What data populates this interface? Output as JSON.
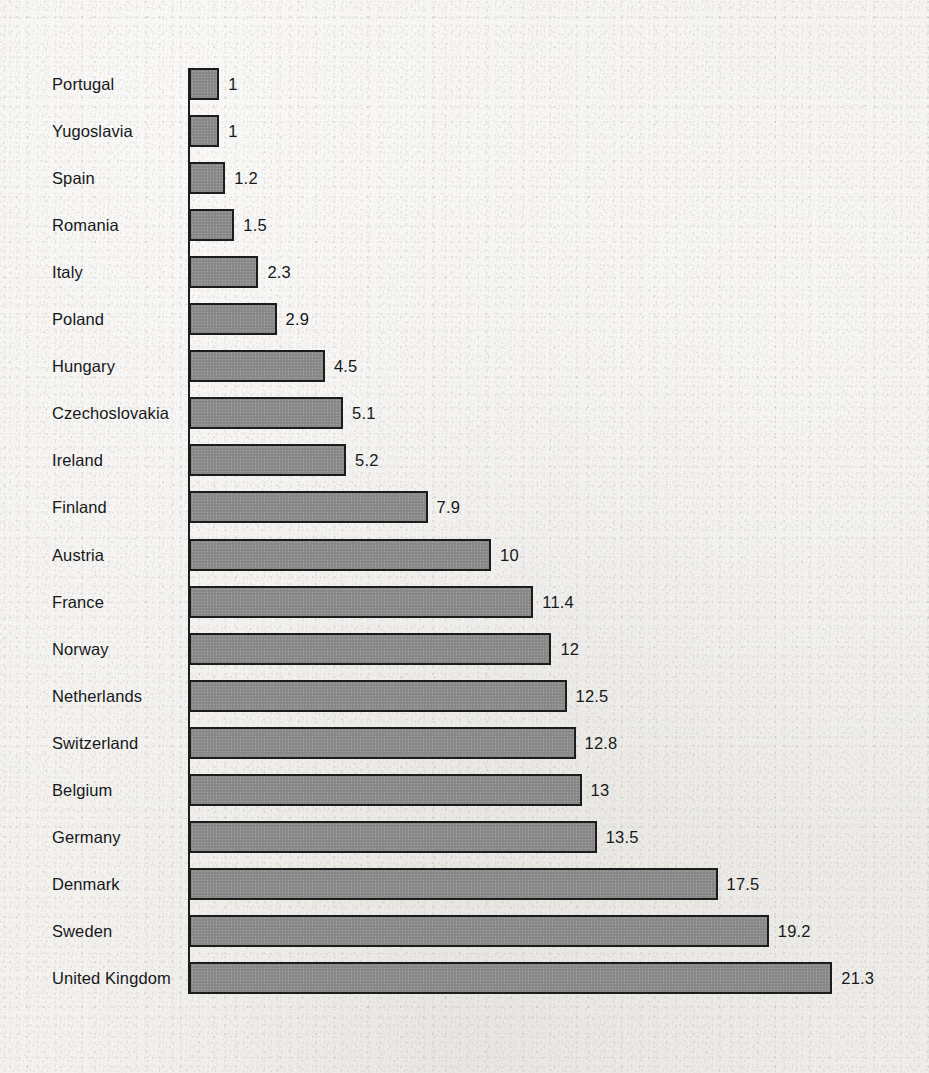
{
  "chart_data": {
    "type": "bar",
    "orientation": "horizontal",
    "title": "",
    "subtitle": "",
    "xlabel": "",
    "ylabel": "",
    "legend": [],
    "grid": false,
    "axis": {
      "category_axis": "vertical-left",
      "value_axis_visible": false,
      "value_tick_labels": [],
      "xlim": [
        0,
        21.3
      ]
    },
    "value_labels_shown": true,
    "categories": [
      "Portugal",
      "Yugoslavia",
      "Spain",
      "Romania",
      "Italy",
      "Poland",
      "Hungary",
      "Czechoslovakia",
      "Ireland",
      "Finland",
      "Austria",
      "France",
      "Norway",
      "Netherlands",
      "Switzerland",
      "Belgium",
      "Germany",
      "Denmark",
      "Sweden",
      "United Kingdom"
    ],
    "values": [
      1,
      1,
      1.2,
      1.5,
      2.3,
      2.9,
      4.5,
      5.1,
      5.2,
      7.9,
      10,
      11.4,
      12,
      12.5,
      12.8,
      13,
      13.5,
      17.5,
      19.2,
      21.3
    ],
    "value_label_text": [
      "1",
      "1",
      "1.2",
      "1.5",
      "2.3",
      "2.9",
      "4.5",
      "5.1",
      "5.2",
      "7.9",
      "10",
      "11.4",
      "12",
      "12.5",
      "12.8",
      "13",
      "13.5",
      "17.5",
      "19.2",
      "21.3"
    ],
    "colors": {
      "bar_fill": "#8b8b8b",
      "bar_border": "#1c1c1c",
      "text": "#17181a",
      "background": "#f4f3f0"
    }
  }
}
